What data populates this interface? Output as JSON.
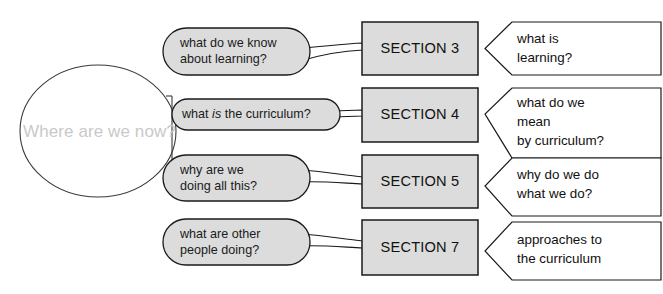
{
  "diagram": {
    "title_circle": {
      "label": "Where are we now?",
      "text_color": "#c9c9c9",
      "stroke_color": "#333333"
    },
    "palette": {
      "section_fill": "#dcdcdc",
      "bubble_fill": "#dcdcdc",
      "callout_fill": "#ffffff",
      "stroke": "#1a1a1a",
      "background": "#ffffff"
    },
    "rows": [
      {
        "question_line1": "what do we know",
        "question_line2": "about learning?",
        "section": "SECTION 3",
        "answer_line1": "what is",
        "answer_line2": "learning?",
        "answer_line3": ""
      },
      {
        "question_line1": "what ",
        "question_italic": "is",
        "question_line1b": " the curriculum?",
        "question_line2": "",
        "section": "SECTION 4",
        "answer_line1": "what do we",
        "answer_line2": "mean",
        "answer_line3": "by curriculum?"
      },
      {
        "question_line1": "why are we",
        "question_line2": "doing all this?",
        "section": "SECTION 5",
        "answer_line1": "why do we do",
        "answer_line2": "what we do?",
        "answer_line3": ""
      },
      {
        "question_line1": "what are other",
        "question_line2": "people doing?",
        "section": "SECTION 7",
        "answer_line1": "approaches to",
        "answer_line2": "the curriculum",
        "answer_line3": ""
      }
    ]
  }
}
